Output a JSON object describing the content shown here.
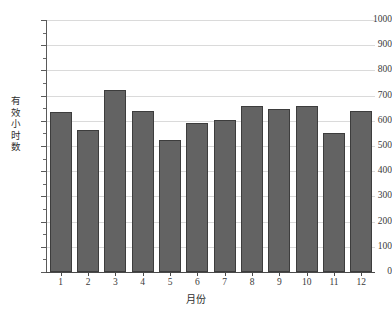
{
  "chart_data": {
    "type": "bar",
    "title": "",
    "xlabel": "月份",
    "ylabel": "有效小时数",
    "categories": [
      "1",
      "2",
      "3",
      "4",
      "5",
      "6",
      "7",
      "8",
      "9",
      "10",
      "11",
      "12"
    ],
    "values": [
      635,
      565,
      723,
      637,
      523,
      592,
      602,
      657,
      645,
      658,
      550,
      638
    ],
    "ylim": [
      0,
      1000
    ],
    "ytick_labels": [
      "0",
      "100",
      "200",
      "300",
      "400",
      "500",
      "600",
      "700",
      "800",
      "900",
      "1000"
    ],
    "ytick_values": [
      0,
      100,
      200,
      300,
      400,
      500,
      600,
      700,
      800,
      900,
      1000
    ],
    "ytick_step": 100,
    "minor_ticks": true,
    "grid": "horizontal",
    "legend": "none",
    "bar_color": "#636363",
    "bar_edge_color": "#3d3d3d",
    "grid_color": "#dadada",
    "axis_color": "#4a4a4a",
    "background": "#ffffff"
  }
}
